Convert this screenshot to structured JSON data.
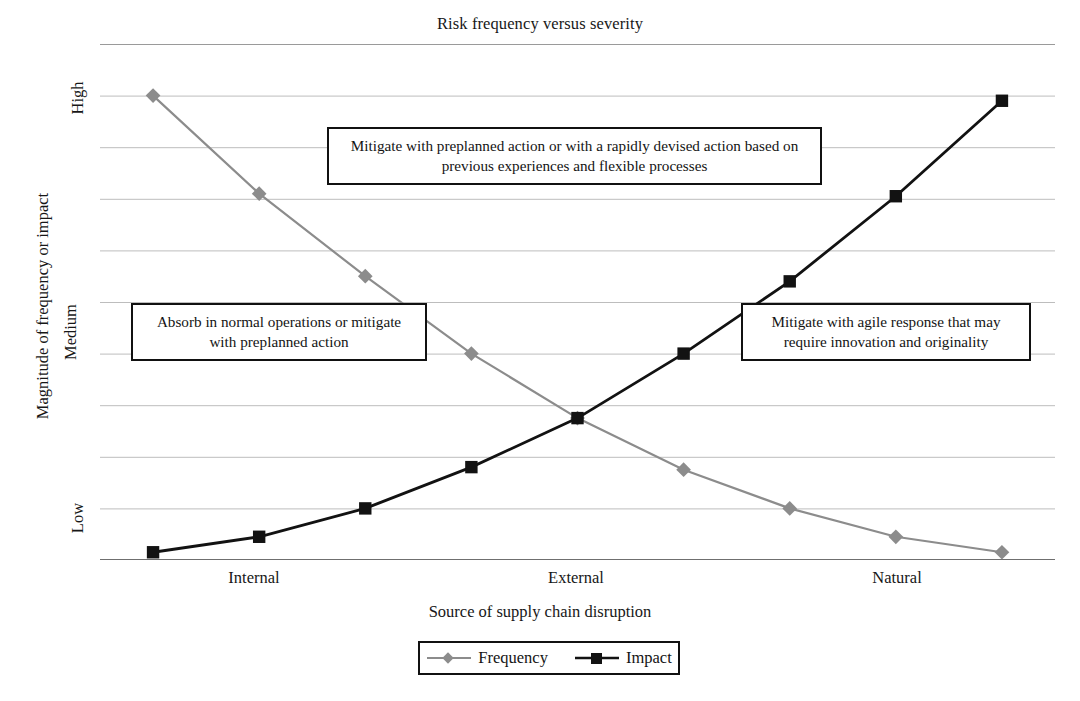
{
  "chart_data": {
    "type": "line",
    "title": "Risk frequency versus severity",
    "xlabel": "Source of supply chain disruption",
    "ylabel": "Magnitude  of frequency or impact",
    "grid": true,
    "legend_position": "bottom",
    "ylim": [
      0,
      10
    ],
    "ytick_labels": [
      "Low",
      "Medium",
      "High"
    ],
    "ytick_values": [
      1.0,
      4.6,
      9.0
    ],
    "xtick_labels": [
      "Internal",
      "External",
      "Natural"
    ],
    "x": [
      1,
      2,
      3,
      4,
      5,
      6,
      7,
      8,
      9
    ],
    "series": [
      {
        "name": "Frequency",
        "color": "#8c8c8c",
        "marker": "diamond",
        "values": [
          9.0,
          7.1,
          5.5,
          4.0,
          2.75,
          1.75,
          1.0,
          0.45,
          0.15
        ]
      },
      {
        "name": "Impact",
        "color": "#121212",
        "marker": "square",
        "values": [
          0.15,
          0.45,
          1.0,
          1.8,
          2.75,
          4.0,
          5.4,
          7.05,
          8.9
        ]
      }
    ],
    "annotations": [
      {
        "id": "top",
        "text": "Mitigate with preplanned action or with a rapidly devised action based on previous experiences and flexible processes"
      },
      {
        "id": "left",
        "text": "Absorb in normal operations or mitigate with preplanned action"
      },
      {
        "id": "right",
        "text": "Mitigate with agile response that may require innovation and originality"
      }
    ]
  },
  "legend": {
    "items": [
      {
        "label": "Frequency"
      },
      {
        "label": "Impact"
      }
    ]
  }
}
